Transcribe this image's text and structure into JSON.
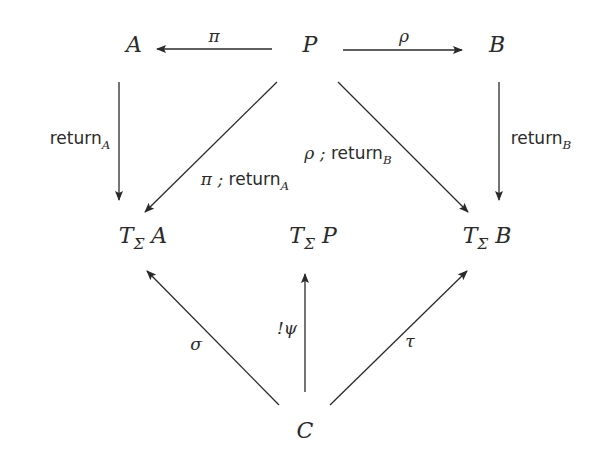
{
  "nodes": {
    "A": {
      "label": "A",
      "x": 134,
      "y": 44
    },
    "P": {
      "label": "P",
      "x": 310,
      "y": 44
    },
    "B": {
      "label": "B",
      "x": 497,
      "y": 44
    },
    "TA": {
      "prefix": "T",
      "sub": "Σ",
      "arg": "A",
      "x": 143,
      "y": 238
    },
    "TP": {
      "prefix": "T",
      "sub": "Σ",
      "arg": "P",
      "x": 313,
      "y": 238
    },
    "TB": {
      "prefix": "T",
      "sub": "Σ",
      "arg": "B",
      "x": 487,
      "y": 238
    },
    "C": {
      "label": "C",
      "x": 305,
      "y": 430
    }
  },
  "edges": [
    {
      "id": "pi",
      "from": "P",
      "to": "A",
      "label": "π"
    },
    {
      "id": "rho",
      "from": "P",
      "to": "B",
      "label": "ρ"
    },
    {
      "id": "returnA",
      "from": "A",
      "to": "TA",
      "label": "return",
      "sub": "A"
    },
    {
      "id": "returnB",
      "from": "B",
      "to": "TB",
      "label": "return",
      "sub": "B"
    },
    {
      "id": "pi-returnA",
      "from": "P",
      "to": "TA",
      "label_pre": "π ; ",
      "label": "return",
      "sub": "A"
    },
    {
      "id": "rho-returnB",
      "from": "P",
      "to": "TB",
      "label_pre": "ρ ; ",
      "label": "return",
      "sub": "B"
    },
    {
      "id": "sigma",
      "from": "C",
      "to": "TA",
      "label": "σ"
    },
    {
      "id": "psi",
      "from": "C",
      "to": "TP",
      "label": "!ψ"
    },
    {
      "id": "tau",
      "from": "C",
      "to": "TB",
      "label": "τ"
    }
  ],
  "colors": {
    "stroke": "#2a2a2a",
    "background": "#ffffff"
  }
}
